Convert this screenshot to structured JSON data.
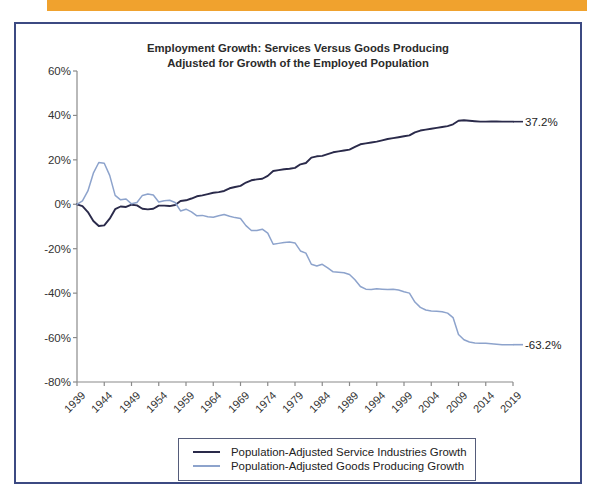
{
  "banner": {
    "text": "Jobs Have Increased"
  },
  "figure": {
    "title_line1": "Employment Growth: Services Versus Goods Producing",
    "title_line2": "Adjusted for Growth of the Employed Population",
    "border_color": "#3c4a82"
  },
  "legend": {
    "position": "bottom-center",
    "items": [
      {
        "label": "Population-Adjusted Service Industries Growth",
        "color": "#2a2a4a"
      },
      {
        "label": "Population-Adjusted Goods Producing Growth",
        "color": "#8da3cc"
      }
    ]
  },
  "annotations": [
    {
      "name": "services-end-value",
      "text": "37.2%",
      "series": "Population-Adjusted Service Industries Growth",
      "value": 37.2
    },
    {
      "name": "goods-end-value",
      "text": "-63.2%",
      "series": "Population-Adjusted Goods Producing Growth",
      "value": -63.2
    }
  ],
  "chart_data": {
    "type": "line",
    "title": "Employment Growth: Services Versus Goods Producing Adjusted for Growth of the Employed Population",
    "xlabel": "",
    "ylabel": "",
    "xlim": [
      1939,
      2019
    ],
    "ylim": [
      -80,
      60
    ],
    "ytick_labels": [
      "60%",
      "40%",
      "20%",
      "0%",
      "-20%",
      "-40%",
      "-60%",
      "-80%"
    ],
    "ytick_values": [
      60,
      40,
      20,
      0,
      -20,
      -40,
      -60,
      -80
    ],
    "xtick_labels": [
      "1939",
      "1944",
      "1949",
      "1954",
      "1959",
      "1964",
      "1969",
      "1974",
      "1979",
      "1984",
      "1989",
      "1994",
      "1999",
      "2004",
      "2009",
      "2014",
      "2019"
    ],
    "xtick_values": [
      1939,
      1944,
      1949,
      1954,
      1959,
      1964,
      1969,
      1974,
      1979,
      1984,
      1989,
      1994,
      1999,
      2004,
      2009,
      2014,
      2019
    ],
    "grid": false,
    "series": [
      {
        "name": "Population-Adjusted Service Industries Growth",
        "color": "#2a2a4a",
        "x": [
          1939,
          1940,
          1941,
          1942,
          1943,
          1944,
          1945,
          1946,
          1947,
          1948,
          1949,
          1950,
          1951,
          1952,
          1953,
          1954,
          1955,
          1956,
          1957,
          1958,
          1959,
          1960,
          1961,
          1962,
          1963,
          1964,
          1965,
          1966,
          1967,
          1968,
          1969,
          1970,
          1971,
          1972,
          1973,
          1974,
          1975,
          1976,
          1977,
          1978,
          1979,
          1980,
          1981,
          1982,
          1983,
          1984,
          1985,
          1986,
          1987,
          1988,
          1989,
          1990,
          1991,
          1992,
          1993,
          1994,
          1995,
          1996,
          1997,
          1998,
          1999,
          2000,
          2001,
          2002,
          2003,
          2004,
          2005,
          2006,
          2007,
          2008,
          2009,
          2010,
          2011,
          2012,
          2013,
          2014,
          2015,
          2016,
          2017,
          2018,
          2019
        ],
        "y": [
          0.0,
          -0.8,
          -3.5,
          -7.5,
          -9.8,
          -9.5,
          -6.5,
          -2.2,
          -1.0,
          -1.2,
          -0.2,
          -0.5,
          -2.0,
          -2.3,
          -2.0,
          -0.6,
          -0.6,
          -0.8,
          -0.3,
          1.5,
          1.8,
          2.6,
          3.6,
          4.0,
          4.6,
          5.2,
          5.5,
          6.0,
          7.2,
          7.8,
          8.3,
          9.8,
          10.8,
          11.2,
          11.5,
          12.8,
          15.0,
          15.4,
          15.8,
          16.0,
          16.4,
          18.0,
          18.6,
          21.0,
          21.6,
          21.8,
          22.6,
          23.4,
          23.8,
          24.2,
          24.6,
          25.8,
          27.0,
          27.4,
          27.8,
          28.2,
          28.8,
          29.4,
          29.8,
          30.2,
          30.6,
          31.0,
          32.4,
          33.2,
          33.6,
          34.0,
          34.4,
          34.8,
          35.2,
          36.0,
          37.6,
          37.8,
          37.6,
          37.4,
          37.2,
          37.2,
          37.3,
          37.3,
          37.2,
          37.2,
          37.2
        ]
      },
      {
        "name": "Population-Adjusted Goods Producing Growth",
        "color": "#8da3cc",
        "x": [
          1939,
          1940,
          1941,
          1942,
          1943,
          1944,
          1945,
          1946,
          1947,
          1948,
          1949,
          1950,
          1951,
          1952,
          1953,
          1954,
          1955,
          1956,
          1957,
          1958,
          1959,
          1960,
          1961,
          1962,
          1963,
          1964,
          1965,
          1966,
          1967,
          1968,
          1969,
          1970,
          1971,
          1972,
          1973,
          1974,
          1975,
          1976,
          1977,
          1978,
          1979,
          1980,
          1981,
          1982,
          1983,
          1984,
          1985,
          1986,
          1987,
          1988,
          1989,
          1990,
          1991,
          1992,
          1993,
          1994,
          1995,
          1996,
          1997,
          1998,
          1999,
          2000,
          2001,
          2002,
          2003,
          2004,
          2005,
          2006,
          2007,
          2008,
          2009,
          2010,
          2011,
          2012,
          2013,
          2014,
          2015,
          2016,
          2017,
          2018,
          2019
        ],
        "y": [
          0.0,
          1.5,
          6.0,
          14.0,
          18.8,
          18.5,
          13.0,
          4.0,
          2.0,
          2.4,
          0.2,
          0.8,
          4.0,
          4.6,
          4.2,
          1.0,
          1.6,
          1.8,
          0.8,
          -3.0,
          -2.2,
          -3.4,
          -5.2,
          -5.0,
          -5.6,
          -5.8,
          -5.2,
          -4.6,
          -5.4,
          -6.0,
          -6.4,
          -9.6,
          -11.8,
          -11.8,
          -11.2,
          -13.0,
          -18.0,
          -17.6,
          -17.2,
          -17.0,
          -17.4,
          -21.0,
          -22.0,
          -27.0,
          -27.8,
          -27.0,
          -28.6,
          -30.4,
          -30.6,
          -30.8,
          -31.6,
          -34.0,
          -37.0,
          -38.2,
          -38.4,
          -38.0,
          -38.2,
          -38.4,
          -38.2,
          -38.6,
          -39.4,
          -40.0,
          -44.0,
          -46.4,
          -47.6,
          -48.0,
          -48.2,
          -48.4,
          -49.0,
          -51.0,
          -58.6,
          -61.0,
          -62.0,
          -62.4,
          -62.6,
          -62.6,
          -62.8,
          -63.0,
          -63.2,
          -63.2,
          -63.2
        ]
      }
    ]
  }
}
